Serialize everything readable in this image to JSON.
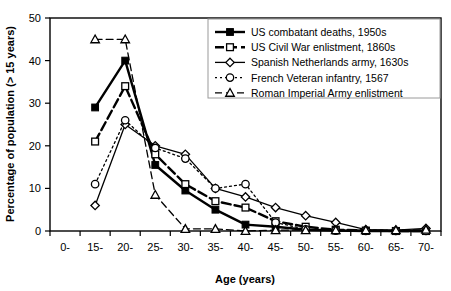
{
  "chart_data": {
    "type": "line",
    "title": "",
    "xlabel": "Age (years)",
    "ylabel": "Percentage of population (> 15 years)",
    "categories": [
      "0-",
      "15-",
      "20-",
      "25-",
      "30-",
      "35-",
      "40-",
      "45-",
      "50-",
      "55-",
      "60-",
      "65-",
      "70-"
    ],
    "ylim": [
      0,
      50
    ],
    "yticks": [
      0,
      10,
      20,
      30,
      40,
      50
    ],
    "grid": false,
    "legend_position": "top-right",
    "series": [
      {
        "name": "US combatant deaths, 1950s",
        "marker": "filled-square",
        "line": "solid",
        "values": [
          null,
          29,
          40,
          15.5,
          9.5,
          5,
          1.5,
          1,
          0.3,
          0.1,
          0,
          0,
          0
        ]
      },
      {
        "name": "US Civil War enlistment, 1860s",
        "marker": "open-square",
        "line": "dashed",
        "values": [
          null,
          21,
          34,
          18,
          11,
          7,
          5.5,
          2.3,
          1,
          0.3,
          0.1,
          0,
          0
        ]
      },
      {
        "name": "Spanish Netherlands army, 1630s",
        "marker": "open-diamond",
        "line": "solid",
        "values": [
          null,
          6,
          25,
          20,
          18,
          10,
          8,
          5.5,
          3.6,
          2,
          0.3,
          0.2,
          0.6
        ]
      },
      {
        "name": "French Veteran infantry, 1567",
        "marker": "open-circle",
        "line": "dotted",
        "values": [
          null,
          11,
          26,
          19.5,
          17,
          10,
          11,
          2,
          0.4,
          0.1,
          0,
          0,
          0
        ]
      },
      {
        "name": "Roman Imperial Army enlistment",
        "marker": "open-triangle",
        "line": "dashed",
        "values": [
          null,
          45,
          45,
          8.5,
          0.5,
          0.5,
          0,
          0.2,
          0.2,
          0.2,
          0.2,
          0.2,
          0.3
        ]
      }
    ]
  },
  "axes": {
    "y_title": "Percentage of population (> 15 years)",
    "x_title": "Age (years)",
    "y_tick_labels": [
      "0",
      "10",
      "20",
      "30",
      "40",
      "50"
    ],
    "x_tick_labels": [
      "0-",
      "15-",
      "20-",
      "25-",
      "30-",
      "35-",
      "40-",
      "45-",
      "50-",
      "55-",
      "60-",
      "65-",
      "70-"
    ]
  },
  "legend": {
    "entries": [
      {
        "label": "US combatant deaths, 1950s"
      },
      {
        "label": "US Civil War enlistment, 1860s"
      },
      {
        "label": "Spanish Netherlands army, 1630s"
      },
      {
        "label": "French Veteran infantry, 1567"
      },
      {
        "label": "Roman Imperial Army enlistment"
      }
    ]
  },
  "colors": {
    "line": "#000000",
    "fill": "#000000",
    "background": "#ffffff",
    "legend_border": "#999999"
  }
}
